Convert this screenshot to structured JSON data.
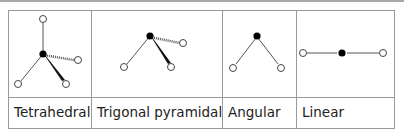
{
  "columns": [
    {
      "label": "Tetrahedral",
      "shape": "tetrahedral"
    },
    {
      "label": "Trigonal pyramidal",
      "shape": "trigonal-pyramidal"
    },
    {
      "label": "Angular",
      "shape": "angular"
    },
    {
      "label": "Linear",
      "shape": "linear"
    }
  ],
  "legend": {
    "central_atom": "filled black circle",
    "outer_atom": "open circle",
    "plain_bond": "thin line (in plane)",
    "wedge_bond": "thick wedge (toward viewer)",
    "dashed_bond": "hashed line (away from viewer)"
  },
  "colors": {
    "border": "#9a9a9a",
    "bond": "#555555",
    "atom_fill": "#000000",
    "text": "#222222"
  }
}
